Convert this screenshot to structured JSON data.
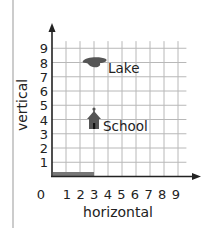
{
  "chart_data": {
    "type": "scatter",
    "title": "",
    "xlabel": "horizontal",
    "ylabel": "vertical",
    "xlim": [
      0,
      9
    ],
    "ylim": [
      0,
      9
    ],
    "grid": true,
    "x_ticks": [
      "0",
      "1",
      "2",
      "3",
      "4",
      "5",
      "6",
      "7",
      "8",
      "9"
    ],
    "y_ticks": [
      "1",
      "2",
      "3",
      "4",
      "5",
      "6",
      "7",
      "8",
      "9"
    ],
    "points": [
      {
        "label": "Lake",
        "x": 3,
        "y": 8,
        "icon": "lake-icon"
      },
      {
        "label": "School",
        "x": 3,
        "y": 4,
        "icon": "school-icon"
      }
    ],
    "highlight_segment": {
      "from_x": 0,
      "to_x": 3,
      "y": 0,
      "color": "#777777"
    }
  },
  "labels": {
    "xlabel": "horizontal",
    "ylabel": "vertical",
    "lake": "Lake",
    "school": "School",
    "origin": "0"
  },
  "colors": {
    "grid": "#b8b8b8",
    "axis": "#222222",
    "icon": "#555555",
    "highlight": "#777777",
    "border": "#999999"
  }
}
